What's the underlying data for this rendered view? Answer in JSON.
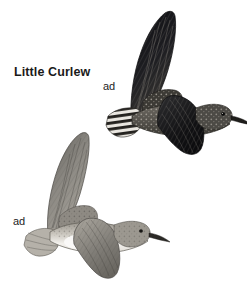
{
  "plate": {
    "background_color": "#ffffff",
    "width": 247,
    "height": 306,
    "species_label": "Little Curlew",
    "text_color": "#1a1a1a"
  },
  "figures": [
    {
      "id": "upper-bird",
      "age_label": "ad",
      "view": "upperside in flight",
      "description": "Little Curlew adult, dorsal view in flight, dark upperwings, barred tail, slightly decurved bill pointing right",
      "tone": "dark",
      "dark_color": "#16161a",
      "mid_color": "#5e5c58",
      "light_color": "#b9b5ae"
    },
    {
      "id": "lower-bird",
      "age_label": "ad",
      "view": "underside in flight",
      "description": "Little Curlew adult, ventral view in flight, pale underparts and whitish belly, grey underwings, slightly decurved bill pointing right",
      "tone": "pale",
      "dark_color": "#4a4845",
      "mid_color": "#8d8a85",
      "light_color": "#e8e6e2"
    }
  ]
}
